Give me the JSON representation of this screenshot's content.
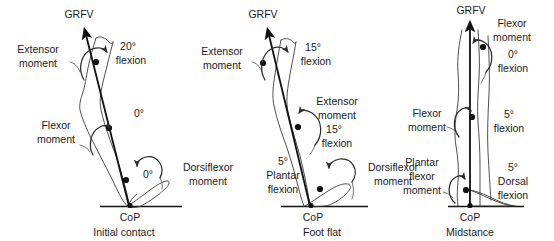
{
  "figure": {
    "type": "diagram",
    "degree_symbol": "°"
  },
  "panels": [
    {
      "id": "initial-contact",
      "caption": "Initial contact",
      "cop_label": "CoP",
      "grfv_label": "GRFV",
      "labels": {
        "hip_moment": "Extensor\nmoment",
        "hip_moment_line1": "Extensor",
        "hip_moment_line2": "moment",
        "knee_moment_line1": "Flexor",
        "knee_moment_line2": "moment",
        "ankle_moment_line1": "Dorsiflexor",
        "ankle_moment_line2": "moment",
        "hip_angle_line1": "20°",
        "hip_angle_line2": "flexion",
        "knee_angle": "0°",
        "ankle_angle": "0°"
      }
    },
    {
      "id": "foot-flat",
      "caption": "Foot flat",
      "cop_label": "CoP",
      "grfv_label": "GRFV",
      "labels": {
        "hip_moment_line1": "Extensor",
        "hip_moment_line2": "moment",
        "knee_moment_line1": "Extensor",
        "knee_moment_line2": "moment",
        "ankle_moment_line1": "Dorsiflexor",
        "ankle_moment_line2": "moment",
        "hip_angle_line1": "15°",
        "hip_angle_line2": "flexion",
        "knee_angle_line1": "15°",
        "knee_angle_line2": "flexion",
        "ankle_angle_line1": "5°",
        "ankle_angle_line2": "Plantar",
        "ankle_angle_line3": "flexion"
      }
    },
    {
      "id": "midstance",
      "caption": "Midstance",
      "cop_label": "CoP",
      "grfv_label": "GRFV",
      "labels": {
        "hip_moment_line1": "Flexor",
        "hip_moment_line2": "moment",
        "knee_moment_line1": "Flexor",
        "knee_moment_line2": "moment",
        "ankle_moment_line1": "Plantar",
        "ankle_moment_line2": "flexor",
        "ankle_moment_line3": "moment",
        "hip_angle_line1": "0°",
        "hip_angle_line2": "flexion",
        "knee_angle_line1": "5°",
        "knee_angle_line2": "flexion",
        "ankle_angle_line1": "5°",
        "ankle_angle_line2": "Dorsal",
        "ankle_angle_line3": "flexion"
      }
    }
  ],
  "colors": {
    "ink": "#111111",
    "limb_outline": "#3b3b3b",
    "moment_arrow": "#2b2b2b",
    "background": "#ffffff"
  }
}
